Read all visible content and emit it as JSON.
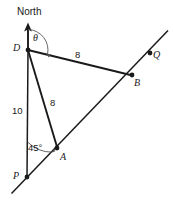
{
  "figure": {
    "type": "geometry-diagram",
    "background_color": "#ffffff",
    "stroke_color": "#1a1a1a",
    "label_color": "#1a1a1a",
    "width": 173,
    "height": 210
  },
  "labels": {
    "north": "North",
    "point_d": "D",
    "point_p": "P",
    "point_a": "A",
    "point_b": "B",
    "point_q": "Q",
    "theta": "θ",
    "angle_45": "45°",
    "len_db": "8",
    "len_da": "8",
    "len_dp": "10"
  },
  "points": [
    {
      "name": "D",
      "label": "D",
      "x": 28,
      "y": 50,
      "dot": true
    },
    {
      "name": "P",
      "label": "P",
      "x": 27,
      "y": 177,
      "dot": true
    },
    {
      "name": "A",
      "label": "A",
      "x": 57,
      "y": 148,
      "dot": true
    },
    {
      "name": "B",
      "label": "B",
      "x": 132,
      "y": 75,
      "dot": true
    },
    {
      "name": "Q",
      "label": "Q",
      "x": 150,
      "y": 53,
      "dot": true
    }
  ],
  "segments": [
    {
      "name": "north-axis",
      "from": "arrow-tip",
      "to": "D",
      "label": ""
    },
    {
      "name": "d-to-p",
      "from": "D",
      "to": "P",
      "label": "10"
    },
    {
      "name": "d-to-b",
      "from": "D",
      "to": "B",
      "label": "8"
    },
    {
      "name": "d-to-a",
      "from": "D",
      "to": "A",
      "label": "8"
    },
    {
      "name": "p-q-line",
      "from": "P",
      "to": "Q",
      "label": ""
    }
  ],
  "angles": [
    {
      "name": "theta-at-d",
      "vertex": "D",
      "label": "θ",
      "from": "north",
      "to": "DB",
      "arrow": true
    },
    {
      "name": "angle-at-p",
      "vertex": "P",
      "label": "45°",
      "from": "north",
      "to": "PA",
      "arrow": true
    }
  ]
}
